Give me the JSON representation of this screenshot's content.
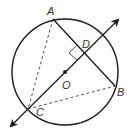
{
  "diagram": {
    "type": "geometry-circle",
    "colors": {
      "stroke": "#1a1a1a",
      "dashed": "#555555",
      "label": "#333333",
      "background": "#ffffff"
    },
    "labels": {
      "A": "A",
      "B": "B",
      "C": "C",
      "D": "D",
      "O": "O"
    },
    "elements": {
      "circle": "circle centered at O",
      "chord_AB": "solid segment AB",
      "line_CD": "line through C, O, D with arrows at both ends",
      "segment_AC": "dashed segment AC",
      "segment_CB": "dashed segment CB",
      "right_angle": "right-angle marker at D between AB and line CD",
      "center_point": "filled dot at O"
    }
  }
}
